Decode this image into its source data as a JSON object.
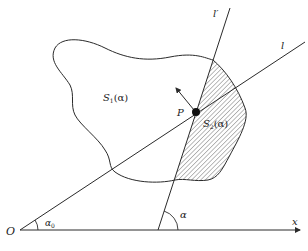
{
  "figure": {
    "labels": {
      "origin": "O",
      "x_axis": "x",
      "line_l": "l",
      "line_l_prime": "l′",
      "point": "P",
      "region1": {
        "main": "S",
        "sub": "1",
        "arg": "(α)"
      },
      "region2": {
        "main": "S",
        "sub": "2",
        "arg": "(α)"
      },
      "angle_alpha0": {
        "main": "α",
        "sub": "0"
      },
      "angle_alpha": "α"
    },
    "colors": {
      "stroke": "#2a2a2a",
      "hatch": "#444444",
      "background": "#ffffff"
    }
  }
}
